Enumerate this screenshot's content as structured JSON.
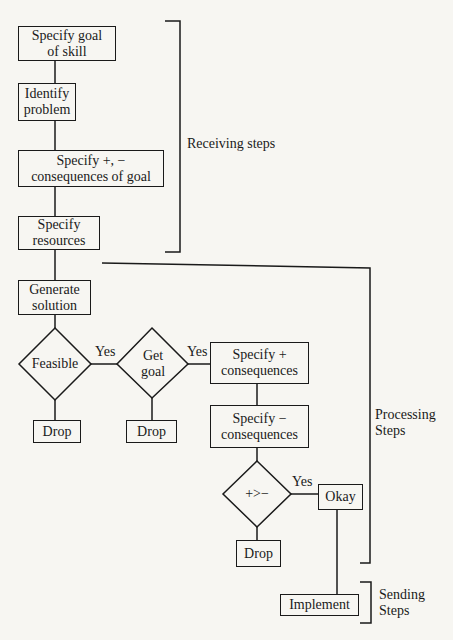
{
  "diagram": {
    "type": "flowchart",
    "nodes": {
      "specify_goal": {
        "label": "Specify goal\nof skill",
        "shape": "rect"
      },
      "identify_problem": {
        "label": "Identify\nproblem",
        "shape": "rect"
      },
      "specify_consequences_goal": {
        "label": "Specify +, −\nconsequences of goal",
        "shape": "rect"
      },
      "specify_resources": {
        "label": "Specify\nresources",
        "shape": "rect"
      },
      "generate_solution": {
        "label": "Generate\nsolution",
        "shape": "rect"
      },
      "feasible": {
        "label": "Feasible",
        "shape": "diamond"
      },
      "get_goal": {
        "label": "Get\ngoal",
        "shape": "diamond"
      },
      "specify_plus": {
        "label": "Specify +\nconsequences",
        "shape": "rect"
      },
      "specify_minus": {
        "label": "Specify −\nconsequences",
        "shape": "rect"
      },
      "compare": {
        "label": "+>−",
        "shape": "diamond"
      },
      "okay": {
        "label": "Okay",
        "shape": "rect"
      },
      "drop_1": {
        "label": "Drop",
        "shape": "rect"
      },
      "drop_2": {
        "label": "Drop",
        "shape": "rect"
      },
      "drop_3": {
        "label": "Drop",
        "shape": "rect"
      },
      "implement": {
        "label": "Implement",
        "shape": "rect"
      }
    },
    "edges": [
      {
        "from": "specify_goal",
        "to": "identify_problem"
      },
      {
        "from": "identify_problem",
        "to": "specify_consequences_goal"
      },
      {
        "from": "specify_consequences_goal",
        "to": "specify_resources"
      },
      {
        "from": "specify_resources",
        "to": "generate_solution"
      },
      {
        "from": "generate_solution",
        "to": "feasible"
      },
      {
        "from": "feasible",
        "to": "get_goal",
        "label": "Yes"
      },
      {
        "from": "feasible",
        "to": "drop_1"
      },
      {
        "from": "get_goal",
        "to": "specify_plus",
        "label": "Yes"
      },
      {
        "from": "get_goal",
        "to": "drop_2"
      },
      {
        "from": "specify_plus",
        "to": "specify_minus"
      },
      {
        "from": "specify_minus",
        "to": "compare"
      },
      {
        "from": "compare",
        "to": "okay",
        "label": "Yes"
      },
      {
        "from": "compare",
        "to": "drop_3"
      },
      {
        "from": "okay",
        "to": "implement"
      }
    ],
    "edge_labels": {
      "yes_1": "Yes",
      "yes_2": "Yes",
      "yes_3": "Yes"
    },
    "groups": {
      "receiving": {
        "label": "Receiving steps"
      },
      "processing": {
        "label": "Processing\nSteps"
      },
      "sending": {
        "label": "Sending\nSteps"
      }
    }
  }
}
